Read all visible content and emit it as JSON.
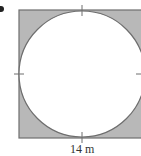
{
  "figure": {
    "type": "square-with-inscribed-circle",
    "shaded_region": "area between square and circle",
    "side_label": "14 m",
    "colors": {
      "shade": "#b8b8b8",
      "stroke": "#6e6e6e",
      "circle_fill": "#ffffff",
      "background": "#ffffff"
    }
  }
}
